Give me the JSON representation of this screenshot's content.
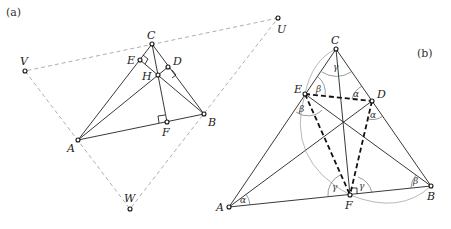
{
  "panels": {
    "a": {
      "tag": "(a)",
      "points": {
        "A": {
          "label": "A",
          "x": 78,
          "y": 140
        },
        "B": {
          "label": "B",
          "x": 204,
          "y": 114
        },
        "C": {
          "label": "C",
          "x": 152,
          "y": 44
        },
        "D": {
          "label": "D",
          "x": 168,
          "y": 67
        },
        "E": {
          "label": "E",
          "x": 140,
          "y": 60
        },
        "F": {
          "label": "F",
          "x": 167,
          "y": 122
        },
        "H": {
          "label": "H",
          "x": 158,
          "y": 75
        },
        "U": {
          "label": "U",
          "x": 278,
          "y": 18
        },
        "V": {
          "label": "V",
          "x": 25,
          "y": 71
        },
        "W": {
          "label": "W",
          "x": 130,
          "y": 209
        }
      }
    },
    "b": {
      "tag": "(b)",
      "points": {
        "A": {
          "label": "A",
          "x": 229,
          "y": 207
        },
        "B": {
          "label": "B",
          "x": 431,
          "y": 186
        },
        "C": {
          "label": "C",
          "x": 336,
          "y": 49
        },
        "D": {
          "label": "D",
          "x": 372,
          "y": 101
        },
        "E": {
          "label": "E",
          "x": 305,
          "y": 94
        },
        "F": {
          "label": "F",
          "x": 350,
          "y": 195
        }
      },
      "angles": {
        "alpha": "α",
        "beta": "β",
        "gamma": "γ"
      }
    }
  }
}
